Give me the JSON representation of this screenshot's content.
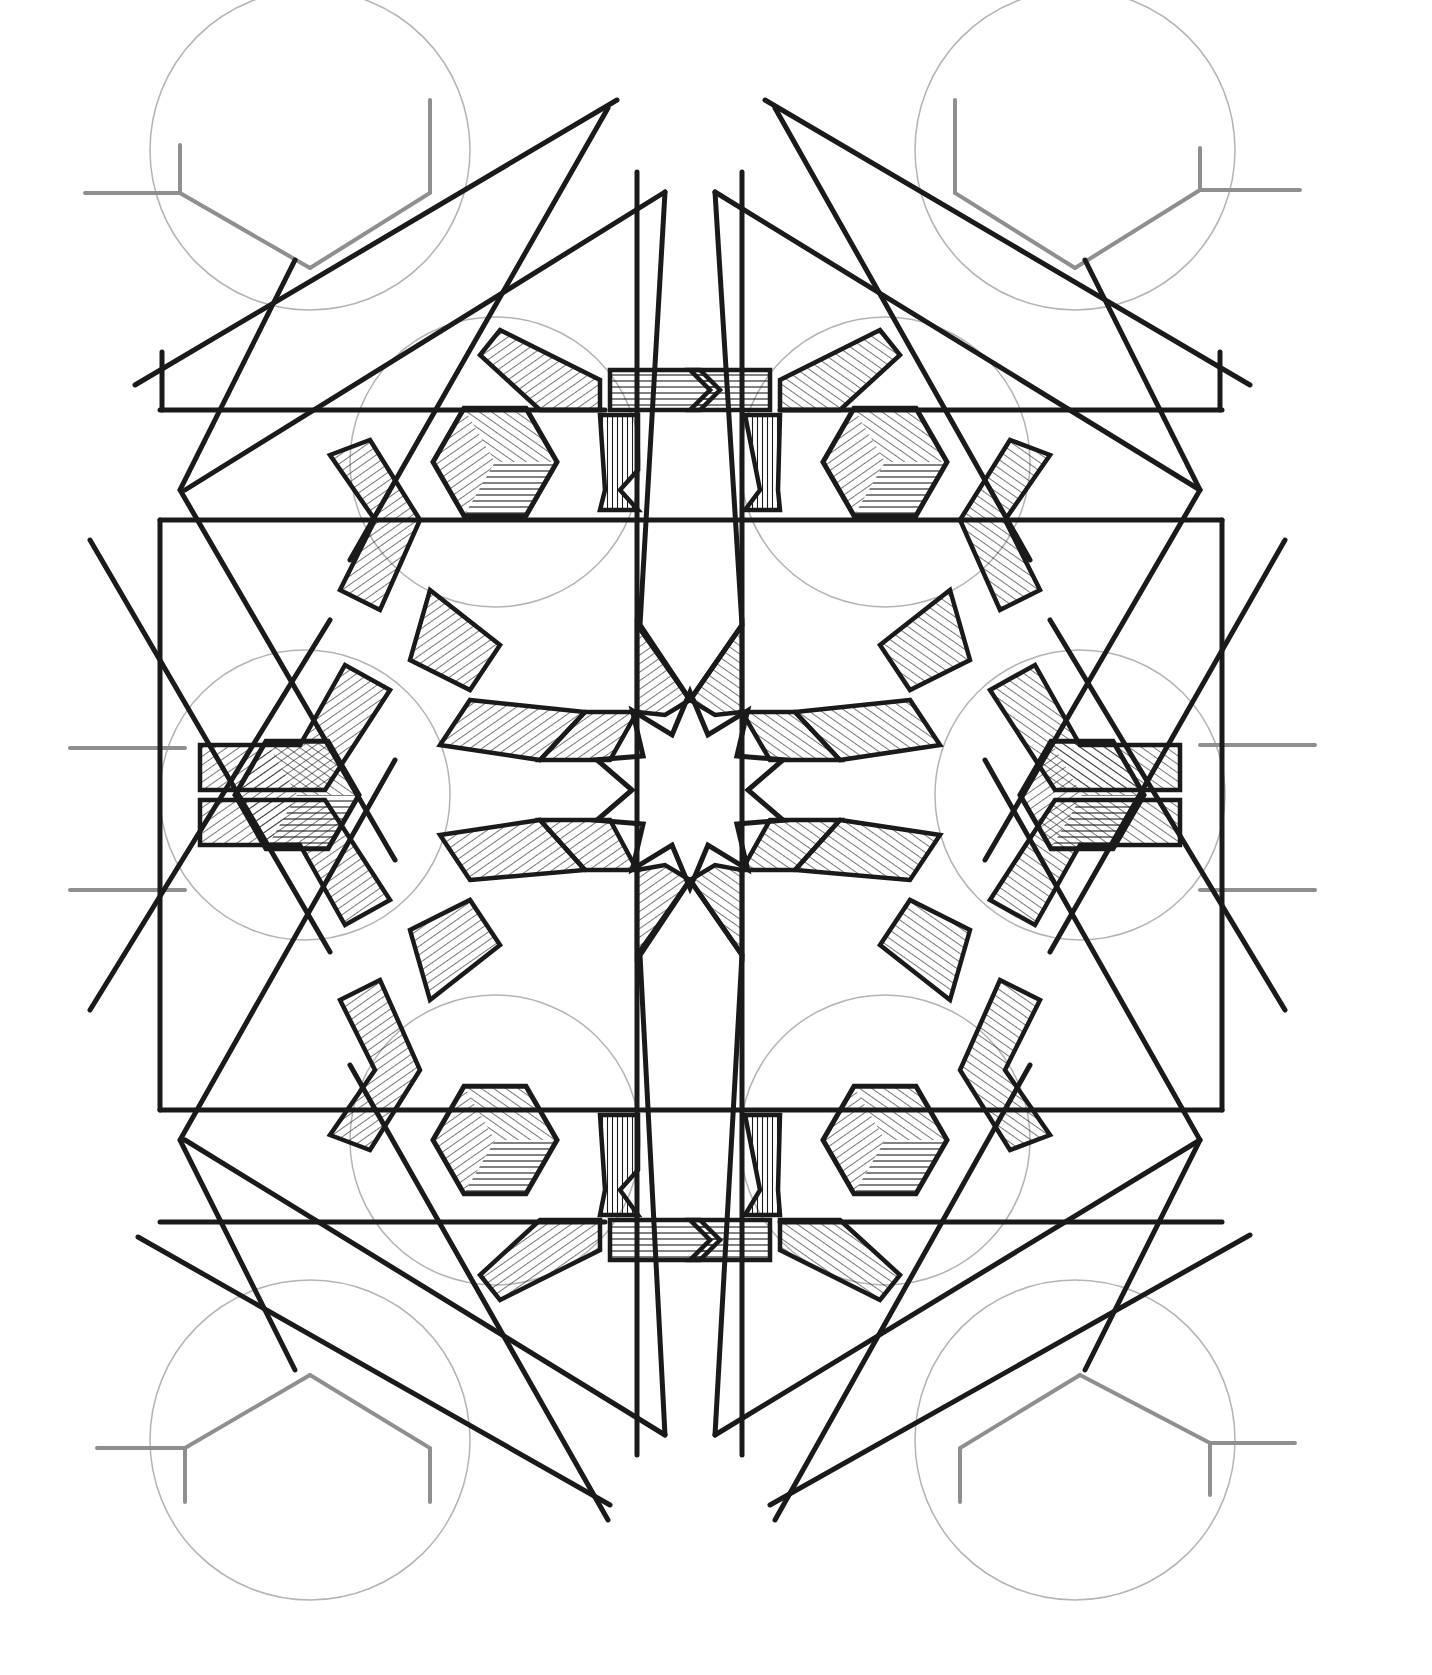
{
  "artwork": {
    "title": "Geometric star pattern drawing",
    "style": "pen and ink with hatching",
    "colors": {
      "ink": "#1a1a1a",
      "construction": "#8f8f8f",
      "construction_circle": "#b4b4b4",
      "paper": "#ffffff"
    },
    "center": [
      690,
      790
    ],
    "central_star": {
      "points": 10,
      "outer_r": 98,
      "inner_r": 58,
      "rotation_deg": 0
    },
    "hex_cubes": [
      {
        "cx": 495,
        "cy": 462,
        "r": 62
      },
      {
        "cx": 885,
        "cy": 462,
        "r": 62
      },
      {
        "cx": 297,
        "cy": 795,
        "r": 62
      },
      {
        "cx": 1082,
        "cy": 795,
        "r": 62
      },
      {
        "cx": 495,
        "cy": 1140,
        "r": 62
      },
      {
        "cx": 885,
        "cy": 1140,
        "r": 62
      }
    ],
    "construction_circles": [
      {
        "cx": 495,
        "cy": 462,
        "r": 145
      },
      {
        "cx": 885,
        "cy": 462,
        "r": 145
      },
      {
        "cx": 305,
        "cy": 795,
        "r": 145
      },
      {
        "cx": 1080,
        "cy": 795,
        "r": 145
      },
      {
        "cx": 495,
        "cy": 1140,
        "r": 145
      },
      {
        "cx": 885,
        "cy": 1140,
        "r": 145
      },
      {
        "cx": 310,
        "cy": 150,
        "r": 160
      },
      {
        "cx": 1075,
        "cy": 150,
        "r": 160
      },
      {
        "cx": 310,
        "cy": 1440,
        "r": 160
      },
      {
        "cx": 1075,
        "cy": 1440,
        "r": 160
      }
    ],
    "grey_branches": [
      [
        [
          85,
          193
        ],
        [
          180,
          193
        ],
        [
          180,
          145
        ]
      ],
      [
        [
          180,
          193
        ],
        [
          310,
          268
        ]
      ],
      [
        [
          310,
          268
        ],
        [
          430,
          193
        ],
        [
          430,
          100
        ]
      ],
      [
        [
          1300,
          190
        ],
        [
          1200,
          190
        ],
        [
          1200,
          148
        ]
      ],
      [
        [
          1200,
          190
        ],
        [
          1075,
          268
        ]
      ],
      [
        [
          1075,
          268
        ],
        [
          955,
          193
        ],
        [
          955,
          100
        ]
      ],
      [
        [
          97,
          1448
        ],
        [
          185,
          1448
        ],
        [
          185,
          1502
        ]
      ],
      [
        [
          185,
          1448
        ],
        [
          310,
          1375
        ]
      ],
      [
        [
          310,
          1375
        ],
        [
          430,
          1448
        ],
        [
          430,
          1502
        ]
      ],
      [
        [
          1295,
          1443
        ],
        [
          1210,
          1443
        ],
        [
          1210,
          1495
        ]
      ],
      [
        [
          1210,
          1443
        ],
        [
          1080,
          1375
        ]
      ],
      [
        [
          1080,
          1375
        ],
        [
          960,
          1448
        ],
        [
          960,
          1502
        ]
      ],
      [
        [
          70,
          748
        ],
        [
          185,
          748
        ]
      ],
      [
        [
          70,
          890
        ],
        [
          185,
          890
        ]
      ],
      [
        [
          1315,
          745
        ],
        [
          1200,
          745
        ]
      ],
      [
        [
          1315,
          890
        ],
        [
          1200,
          890
        ]
      ]
    ],
    "ink_lines": [
      [
        [
          637,
          172
        ],
        [
          637,
          1455
        ]
      ],
      [
        [
          742,
          172
        ],
        [
          742,
          1455
        ]
      ],
      [
        [
          160,
          520
        ],
        [
          1222,
          520
        ]
      ],
      [
        [
          160,
          1110
        ],
        [
          1222,
          1110
        ]
      ],
      [
        [
          160,
          410
        ],
        [
          605,
          410
        ]
      ],
      [
        [
          780,
          410
        ],
        [
          1222,
          410
        ]
      ],
      [
        [
          160,
          520
        ],
        [
          160,
          1110
        ]
      ],
      [
        [
          1222,
          520
        ],
        [
          1222,
          1110
        ]
      ],
      [
        [
          160,
          1222
        ],
        [
          605,
          1222
        ]
      ],
      [
        [
          780,
          1222
        ],
        [
          1222,
          1222
        ]
      ],
      [
        [
          162,
          352
        ],
        [
          162,
          410
        ]
      ],
      [
        [
          1220,
          352
        ],
        [
          1220,
          410
        ]
      ],
      [
        [
          617,
          100
        ],
        [
          135,
          385
        ]
      ],
      [
        [
          765,
          100
        ],
        [
          1250,
          385
        ]
      ],
      [
        [
          138,
          1237
        ],
        [
          610,
          1505
        ]
      ],
      [
        [
          1250,
          1235
        ],
        [
          770,
          1505
        ]
      ],
      [
        [
          665,
          192
        ],
        [
          185,
          490
        ]
      ],
      [
        [
          715,
          192
        ],
        [
          1200,
          490
        ]
      ],
      [
        [
          665,
          1435
        ],
        [
          185,
          1140
        ]
      ],
      [
        [
          715,
          1435
        ],
        [
          1200,
          1140
        ]
      ],
      [
        [
          608,
          108
        ],
        [
          350,
          560
        ]
      ],
      [
        [
          775,
          108
        ],
        [
          1030,
          560
        ]
      ],
      [
        [
          608,
          1520
        ],
        [
          350,
          1065
        ]
      ],
      [
        [
          775,
          1520
        ],
        [
          1030,
          1065
        ]
      ],
      [
        [
          90,
          540
        ],
        [
          330,
          952
        ]
      ],
      [
        [
          1285,
          540
        ],
        [
          1050,
          952
        ]
      ],
      [
        [
          90,
          1010
        ],
        [
          330,
          620
        ]
      ],
      [
        [
          1285,
          1010
        ],
        [
          1050,
          620
        ]
      ],
      [
        [
          295,
          260
        ],
        [
          180,
          490
        ],
        [
          395,
          860
        ]
      ],
      [
        [
          1085,
          260
        ],
        [
          1200,
          490
        ],
        [
          985,
          860
        ]
      ],
      [
        [
          295,
          1370
        ],
        [
          180,
          1140
        ],
        [
          395,
          760
        ]
      ],
      [
        [
          1085,
          1370
        ],
        [
          1200,
          1140
        ],
        [
          985,
          760
        ]
      ],
      [
        [
          690,
          700
        ],
        [
          640,
          625
        ],
        [
          665,
          192
        ]
      ],
      [
        [
          690,
          700
        ],
        [
          742,
          625
        ],
        [
          715,
          192
        ]
      ],
      [
        [
          690,
          880
        ],
        [
          640,
          955
        ],
        [
          665,
          1435
        ]
      ],
      [
        [
          690,
          880
        ],
        [
          742,
          955
        ],
        [
          715,
          1435
        ]
      ]
    ],
    "strap_bands": [
      [
        [
          610,
          370
        ],
        [
          700,
          370
        ],
        [
          720,
          390
        ],
        [
          700,
          410
        ],
        [
          610,
          410
        ]
      ],
      [
        [
          770,
          370
        ],
        [
          690,
          370
        ],
        [
          710,
          390
        ],
        [
          690,
          410
        ],
        [
          770,
          410
        ]
      ],
      [
        [
          610,
          1220
        ],
        [
          700,
          1220
        ],
        [
          720,
          1240
        ],
        [
          700,
          1260
        ],
        [
          610,
          1260
        ]
      ],
      [
        [
          770,
          1220
        ],
        [
          690,
          1220
        ],
        [
          710,
          1240
        ],
        [
          690,
          1260
        ],
        [
          770,
          1260
        ]
      ],
      [
        [
          600,
          415
        ],
        [
          638,
          415
        ],
        [
          638,
          470
        ],
        [
          620,
          490
        ],
        [
          638,
          510
        ],
        [
          600,
          510
        ],
        [
          605,
          490
        ]
      ],
      [
        [
          745,
          415
        ],
        [
          780,
          415
        ],
        [
          778,
          490
        ],
        [
          780,
          510
        ],
        [
          745,
          510
        ],
        [
          760,
          490
        ]
      ],
      [
        [
          600,
          1115
        ],
        [
          638,
          1115
        ],
        [
          638,
          1170
        ],
        [
          620,
          1190
        ],
        [
          638,
          1215
        ],
        [
          600,
          1215
        ],
        [
          605,
          1190
        ]
      ],
      [
        [
          745,
          1115
        ],
        [
          780,
          1115
        ],
        [
          778,
          1190
        ],
        [
          780,
          1215
        ],
        [
          745,
          1215
        ],
        [
          760,
          1190
        ]
      ],
      [
        [
          500,
          330
        ],
        [
          600,
          380
        ],
        [
          600,
          410
        ],
        [
          540,
          410
        ],
        [
          480,
          355
        ]
      ],
      [
        [
          880,
          330
        ],
        [
          780,
          380
        ],
        [
          780,
          410
        ],
        [
          840,
          410
        ],
        [
          900,
          355
        ]
      ],
      [
        [
          500,
          1300
        ],
        [
          600,
          1250
        ],
        [
          600,
          1220
        ],
        [
          540,
          1220
        ],
        [
          480,
          1275
        ]
      ],
      [
        [
          880,
          1300
        ],
        [
          780,
          1250
        ],
        [
          780,
          1220
        ],
        [
          840,
          1220
        ],
        [
          900,
          1275
        ]
      ],
      [
        [
          200,
          745
        ],
        [
          300,
          745
        ],
        [
          345,
          665
        ],
        [
          390,
          690
        ],
        [
          325,
          790
        ],
        [
          200,
          790
        ]
      ],
      [
        [
          1180,
          745
        ],
        [
          1080,
          745
        ],
        [
          1035,
          665
        ],
        [
          990,
          690
        ],
        [
          1055,
          790
        ],
        [
          1180,
          790
        ]
      ],
      [
        [
          200,
          845
        ],
        [
          300,
          845
        ],
        [
          345,
          925
        ],
        [
          390,
          900
        ],
        [
          325,
          800
        ],
        [
          200,
          800
        ]
      ],
      [
        [
          1180,
          845
        ],
        [
          1080,
          845
        ],
        [
          1035,
          925
        ],
        [
          990,
          900
        ],
        [
          1055,
          800
        ],
        [
          1180,
          800
        ]
      ],
      [
        [
          370,
          440
        ],
        [
          420,
          520
        ],
        [
          380,
          610
        ],
        [
          340,
          590
        ],
        [
          375,
          520
        ],
        [
          330,
          455
        ]
      ],
      [
        [
          1010,
          440
        ],
        [
          960,
          520
        ],
        [
          1000,
          610
        ],
        [
          1040,
          590
        ],
        [
          1005,
          520
        ],
        [
          1050,
          455
        ]
      ],
      [
        [
          370,
          1150
        ],
        [
          420,
          1070
        ],
        [
          380,
          980
        ],
        [
          340,
          1000
        ],
        [
          375,
          1070
        ],
        [
          330,
          1135
        ]
      ],
      [
        [
          1010,
          1150
        ],
        [
          960,
          1070
        ],
        [
          1000,
          980
        ],
        [
          1040,
          1000
        ],
        [
          1005,
          1070
        ],
        [
          1050,
          1135
        ]
      ],
      [
        [
          430,
          590
        ],
        [
          500,
          645
        ],
        [
          470,
          690
        ],
        [
          410,
          660
        ]
      ],
      [
        [
          950,
          590
        ],
        [
          880,
          645
        ],
        [
          910,
          690
        ],
        [
          970,
          660
        ]
      ],
      [
        [
          430,
          1000
        ],
        [
          500,
          945
        ],
        [
          470,
          900
        ],
        [
          410,
          930
        ]
      ],
      [
        [
          950,
          1000
        ],
        [
          880,
          945
        ],
        [
          910,
          900
        ],
        [
          970,
          930
        ]
      ]
    ],
    "star_hatch_wedges": [
      [
        [
          637,
          625
        ],
        [
          690,
          700
        ],
        [
          665,
          715
        ],
        [
          637,
          712
        ]
      ],
      [
        [
          742,
          625
        ],
        [
          690,
          700
        ],
        [
          715,
          715
        ],
        [
          742,
          712
        ]
      ],
      [
        [
          637,
          955
        ],
        [
          690,
          880
        ],
        [
          665,
          865
        ],
        [
          637,
          870
        ]
      ],
      [
        [
          742,
          955
        ],
        [
          690,
          880
        ],
        [
          715,
          865
        ],
        [
          742,
          870
        ]
      ],
      [
        [
          585,
          712
        ],
        [
          637,
          712
        ],
        [
          610,
          760
        ],
        [
          540,
          760
        ]
      ],
      [
        [
          795,
          712
        ],
        [
          742,
          712
        ],
        [
          770,
          760
        ],
        [
          840,
          760
        ]
      ],
      [
        [
          585,
          870
        ],
        [
          637,
          870
        ],
        [
          610,
          820
        ],
        [
          540,
          820
        ]
      ],
      [
        [
          795,
          870
        ],
        [
          742,
          870
        ],
        [
          770,
          820
        ],
        [
          840,
          820
        ]
      ],
      [
        [
          470,
          700
        ],
        [
          585,
          712
        ],
        [
          540,
          760
        ],
        [
          440,
          745
        ]
      ],
      [
        [
          910,
          700
        ],
        [
          795,
          712
        ],
        [
          840,
          760
        ],
        [
          940,
          745
        ]
      ],
      [
        [
          470,
          880
        ],
        [
          585,
          870
        ],
        [
          540,
          820
        ],
        [
          440,
          835
        ]
      ],
      [
        [
          910,
          880
        ],
        [
          795,
          870
        ],
        [
          840,
          820
        ],
        [
          940,
          835
        ]
      ]
    ]
  }
}
